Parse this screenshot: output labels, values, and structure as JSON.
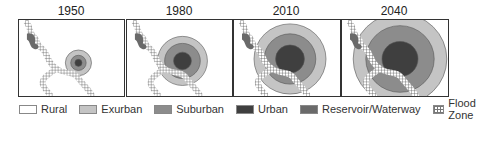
{
  "panels": [
    {
      "title": "1950",
      "rings": {
        "exurban": 0.22,
        "suburban": 0.13,
        "urban": 0.06
      }
    },
    {
      "title": "1980",
      "rings": {
        "exurban": 0.42,
        "suburban": 0.3,
        "urban": 0.15
      }
    },
    {
      "title": "2010",
      "rings": {
        "exurban": 0.6,
        "suburban": 0.43,
        "urban": 0.24
      }
    },
    {
      "title": "2040",
      "rings": {
        "exurban": 0.78,
        "suburban": 0.57,
        "urban": 0.3
      }
    }
  ],
  "legend": [
    {
      "label": "Rural",
      "color": "#ffffff",
      "pattern": "none"
    },
    {
      "label": "Exurban",
      "color": "#c4c4c4",
      "pattern": "none"
    },
    {
      "label": "Suburban",
      "color": "#8c8c8c",
      "pattern": "none"
    },
    {
      "label": "Urban",
      "color": "#3f3f3f",
      "pattern": "none"
    },
    {
      "label": "Reservoir/Waterway",
      "color": "#6a6a6a",
      "pattern": "none"
    },
    {
      "label": "Flood Zone",
      "color": "#ffffff",
      "pattern": "grid"
    }
  ]
}
